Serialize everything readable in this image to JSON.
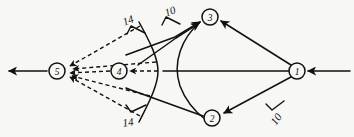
{
  "diagram": {
    "type": "network-flow-graph",
    "background_color": "#f7f7f5",
    "line_color": "#111111",
    "nodes": [
      {
        "id": "1",
        "label": "1",
        "cx": 297,
        "cy": 71,
        "r": 8
      },
      {
        "id": "2",
        "label": "2",
        "cx": 212,
        "cy": 118,
        "r": 8
      },
      {
        "id": "3",
        "label": "3",
        "cx": 210,
        "cy": 17,
        "r": 8
      },
      {
        "id": "4",
        "label": "4",
        "cx": 119,
        "cy": 71,
        "r": 8
      },
      {
        "id": "5",
        "label": "5",
        "cx": 57,
        "cy": 71,
        "r": 8
      }
    ],
    "edge_labels": [
      {
        "id": "label-14-top",
        "text": "14",
        "x": 128,
        "y": 20
      },
      {
        "id": "label-10-top",
        "text": "10",
        "x": 170,
        "y": 11
      },
      {
        "id": "label-14-bottom",
        "text": "14",
        "x": 128,
        "y": 122
      },
      {
        "id": "label-10-bottom",
        "text": "10",
        "x": 276,
        "y": 119
      }
    ],
    "solid_edges": [
      {
        "from": "1",
        "to": "3",
        "style": "solid"
      },
      {
        "from": "1",
        "to": "2",
        "style": "solid"
      },
      {
        "from": "1",
        "to": "4",
        "style": "solid"
      },
      {
        "from": "3",
        "to": "5",
        "style": "solid"
      },
      {
        "from": "2",
        "to": "5",
        "style": "solid"
      },
      {
        "from": "source",
        "to": "1",
        "style": "solid"
      },
      {
        "from": "5",
        "to": "sink",
        "style": "solid"
      }
    ],
    "dashed_edges": [
      {
        "from": "curve-top",
        "to": "5",
        "style": "dashed"
      },
      {
        "from": "curve-mid",
        "to": "4",
        "style": "dashed"
      },
      {
        "from": "curve-mid",
        "to": "5",
        "style": "dashed"
      },
      {
        "from": "curve-bottom",
        "to": "5",
        "style": "dashed"
      }
    ],
    "curve": {
      "id": "wavefront-curve",
      "style": "solid"
    }
  }
}
